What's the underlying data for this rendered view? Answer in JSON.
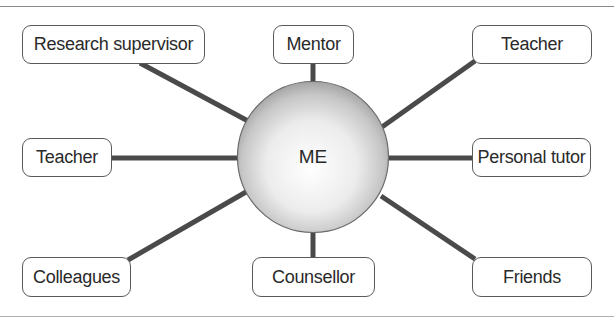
{
  "diagram": {
    "type": "mind-map",
    "center": {
      "label": "ME"
    },
    "nodes": [
      {
        "id": "research-supervisor",
        "label": "Research supervisor"
      },
      {
        "id": "mentor",
        "label": "Mentor"
      },
      {
        "id": "teacher-top-right",
        "label": "Teacher"
      },
      {
        "id": "teacher-left",
        "label": "Teacher"
      },
      {
        "id": "personal-tutor",
        "label": "Personal tutor"
      },
      {
        "id": "colleagues",
        "label": "Colleagues"
      },
      {
        "id": "counsellor",
        "label": "Counsellor"
      },
      {
        "id": "friends",
        "label": "Friends"
      }
    ],
    "colors": {
      "connector": "#4a4a4a",
      "node_border": "#5a5a5a",
      "sphere_light": "#ffffff",
      "sphere_dark": "#a8a8a8"
    }
  }
}
